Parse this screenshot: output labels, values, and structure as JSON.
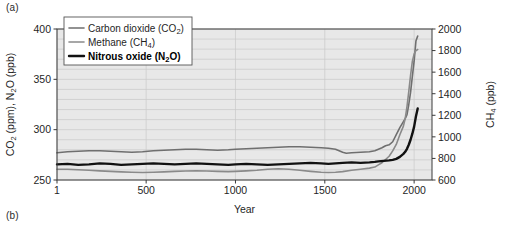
{
  "figure": {
    "panel_a_label": "(a)",
    "panel_b_label": "(b)"
  },
  "chart_data": {
    "type": "line",
    "title": "",
    "xlabel": "Year",
    "ylabel_left_parts": [
      "CO",
      "2",
      " (ppm), N",
      "2",
      "O (ppb)"
    ],
    "ylabel_left": "CO2 (ppm), N2O (ppb)",
    "ylabel_right_parts": [
      "CH",
      "4",
      " (ppb)"
    ],
    "ylabel_right": "CH4 (ppb)",
    "grid": true,
    "legend_position": "top-left",
    "xlim": [
      1,
      2100
    ],
    "x_ticks": [
      1,
      500,
      1000,
      1500,
      2000
    ],
    "x_tick_labels": [
      "1",
      "500",
      "1000",
      "1500",
      "2000"
    ],
    "ylim_left": [
      250,
      400
    ],
    "y_ticks_left": [
      250,
      300,
      350,
      400
    ],
    "y_tick_labels_left": [
      "250",
      "300",
      "350",
      "400"
    ],
    "y_minor_step_left": 10,
    "ylim_right": [
      600,
      2000
    ],
    "y_ticks_right": [
      600,
      800,
      1000,
      1200,
      1400,
      1600,
      1800,
      2000
    ],
    "y_tick_labels_right": [
      "600",
      "800",
      "1000",
      "1200",
      "1400",
      "1600",
      "1800",
      "2000"
    ],
    "colors": {
      "co2": "#6f6f6f",
      "ch4": "#8a8a8a",
      "n2o": "#111111",
      "plot_background": "#e8e8e8",
      "grid": "#c9c9c9",
      "axis": "#3a3a3a"
    },
    "series": [
      {
        "name": "Carbon dioxide (CO2)",
        "legend_parts": [
          "Carbon dioxide (CO",
          "2",
          ")"
        ],
        "axis": "left",
        "units": "ppm",
        "color": "#6f6f6f",
        "width": 1.6,
        "x": [
          1,
          60,
          120,
          180,
          240,
          300,
          360,
          420,
          480,
          540,
          600,
          660,
          720,
          780,
          840,
          900,
          960,
          1000,
          1060,
          1120,
          1180,
          1240,
          1300,
          1360,
          1420,
          1480,
          1520,
          1560,
          1600,
          1620,
          1650,
          1700,
          1750,
          1780,
          1800,
          1820,
          1840,
          1860,
          1880,
          1900,
          1920,
          1940,
          1950,
          1960,
          1970,
          1980,
          1990,
          2000,
          2010,
          2020
        ],
        "y": [
          277,
          278,
          278.5,
          279,
          279,
          278.5,
          278,
          277.5,
          278,
          279,
          279.5,
          280,
          280.5,
          280.5,
          280,
          279.5,
          280,
          280.5,
          281,
          281.5,
          282,
          282.5,
          283,
          283,
          282.5,
          282,
          281.5,
          280.5,
          277.5,
          276.5,
          277,
          277.5,
          278,
          279,
          280.5,
          282,
          284,
          285,
          288,
          295,
          302,
          308,
          311,
          315,
          325,
          337,
          353,
          368,
          388,
          393
        ]
      },
      {
        "name": "Methane (CH4)",
        "legend_parts": [
          "Methane (CH",
          "4",
          ")"
        ],
        "axis": "right",
        "units": "ppb",
        "color": "#8a8a8a",
        "width": 1.6,
        "x": [
          1,
          60,
          120,
          180,
          240,
          300,
          360,
          420,
          480,
          540,
          600,
          660,
          720,
          780,
          840,
          900,
          960,
          1000,
          1060,
          1120,
          1180,
          1240,
          1300,
          1360,
          1420,
          1480,
          1520,
          1560,
          1600,
          1650,
          1700,
          1750,
          1780,
          1800,
          1820,
          1840,
          1860,
          1880,
          1900,
          1920,
          1940,
          1950,
          1960,
          1970,
          1980,
          1990,
          2000,
          2010,
          2020
        ],
        "y": [
          700,
          700,
          695,
          690,
          685,
          680,
          675,
          672,
          670,
          672,
          675,
          680,
          683,
          685,
          683,
          680,
          678,
          680,
          685,
          690,
          700,
          705,
          700,
          690,
          680,
          672,
          670,
          672,
          678,
          690,
          700,
          710,
          720,
          740,
          760,
          790,
          820,
          870,
          930,
          1020,
          1100,
          1170,
          1280,
          1420,
          1570,
          1700,
          1770,
          1800,
          1810
        ]
      },
      {
        "name": "Nitrous oxide (N2O)",
        "legend_parts": [
          "Nitrous oxide (N",
          "2",
          "O)"
        ],
        "axis": "left",
        "units": "ppb",
        "color": "#111111",
        "width": 2.4,
        "x": [
          1,
          60,
          120,
          180,
          240,
          300,
          360,
          420,
          480,
          540,
          600,
          660,
          720,
          780,
          840,
          900,
          960,
          1000,
          1060,
          1120,
          1180,
          1240,
          1300,
          1360,
          1420,
          1480,
          1520,
          1560,
          1600,
          1650,
          1700,
          1750,
          1780,
          1800,
          1830,
          1860,
          1880,
          1900,
          1920,
          1940,
          1950,
          1960,
          1970,
          1980,
          1990,
          2000,
          2010,
          2020
        ],
        "y": [
          265.5,
          266,
          265,
          265.5,
          266.5,
          266,
          265,
          265.5,
          266,
          266.5,
          266,
          265.5,
          266,
          266.5,
          266,
          265.5,
          265,
          265.5,
          266,
          265.5,
          265,
          265.5,
          266,
          266.5,
          267,
          266.5,
          266,
          266.5,
          267,
          267.5,
          267,
          267.5,
          268,
          268.5,
          269,
          269.5,
          270,
          271,
          273,
          276,
          278,
          281,
          285,
          290,
          296,
          303,
          313,
          321
        ]
      }
    ]
  }
}
